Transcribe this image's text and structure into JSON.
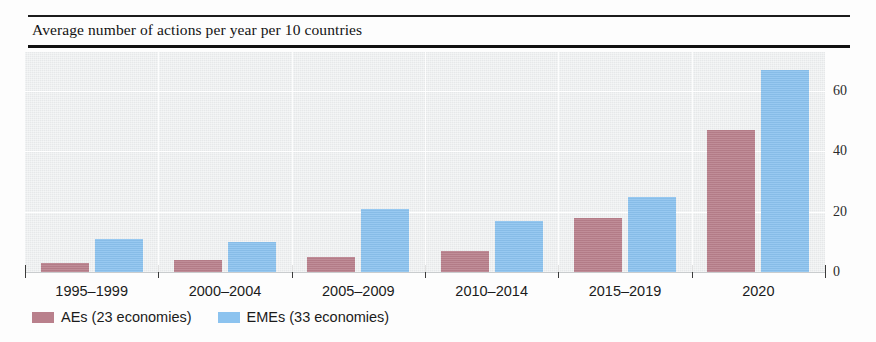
{
  "figure": {
    "title": "Average number of actions per year per 10 countries"
  },
  "chart_data": {
    "type": "bar",
    "title": "Average number of actions per year per 10 countries",
    "xlabel": "",
    "ylabel": "",
    "ylim": [
      0,
      73
    ],
    "yticks": [
      0,
      20,
      40,
      60
    ],
    "ytick_labels": [
      "0",
      "20",
      "40",
      "60"
    ],
    "grid": true,
    "grid_axis": "y",
    "legend_position": "below-axis-left",
    "categories": [
      "1995–1999",
      "2000–2004",
      "2005–2009",
      "2010–2014",
      "2015–2019",
      "2020"
    ],
    "series": [
      {
        "name": "AEs (23 economies)",
        "color": "#b9808c",
        "values": [
          3,
          4,
          5,
          7,
          18,
          47
        ]
      },
      {
        "name": "EMEs (33 economies)",
        "color": "#8cc3ef",
        "values": [
          11,
          10,
          21,
          17,
          25,
          67
        ]
      }
    ]
  },
  "legend": {
    "items": [
      {
        "label": "AEs (23 economies)",
        "color": "#b9808c",
        "swatch": "ae"
      },
      {
        "label": "EMEs (33 economies)",
        "color": "#8cc3ef",
        "swatch": "eme"
      }
    ]
  }
}
